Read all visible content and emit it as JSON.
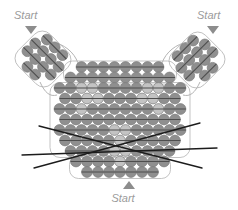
{
  "diagram": {
    "labels": {
      "top_left": "Start",
      "top_right": "Start",
      "bottom": "Start"
    },
    "colors": {
      "background": "#ffffff",
      "bead_dark": "#8f8f8f",
      "bead_light": "#c3c3c3",
      "bead_edge": "#7c7c7c",
      "thread": "#4e4e4e",
      "outline": "#b4b4b4",
      "whisker": "#1c1c1c",
      "label_text": "#9b9b9b",
      "arrow": "#8d8d8d"
    },
    "bead": {
      "size": 11,
      "radius": 5.4
    },
    "arrows": [
      {
        "name": "start-arrow-top-left-icon",
        "points": "25,26 37,26 31,34"
      },
      {
        "name": "start-arrow-top-right-icon",
        "points": "207,26 219,26 213,34"
      },
      {
        "name": "start-arrow-bottom-icon",
        "points": "123,189 135,189 129,181"
      }
    ],
    "ears": [
      {
        "name": "left-ear",
        "cx": 43,
        "cy": 59,
        "rot": 45,
        "rows": [
          3,
          4,
          4,
          2
        ]
      },
      {
        "name": "right-ear",
        "cx": 197,
        "cy": 60,
        "rot": -45,
        "rows": [
          3,
          4,
          4,
          2
        ]
      }
    ],
    "face": {
      "center_x": 120,
      "rows": [
        {
          "y": 67,
          "n": 8,
          "light": []
        },
        {
          "y": 77.5,
          "n": 10,
          "light": []
        },
        {
          "y": 88,
          "n": 12,
          "light": [
            2,
            3,
            8,
            9
          ]
        },
        {
          "y": 98.5,
          "n": 11,
          "light": [
            2,
            3,
            7,
            8
          ]
        },
        {
          "y": 109,
          "n": 12,
          "light": [
            2,
            9
          ]
        },
        {
          "y": 119.5,
          "n": 11,
          "light": []
        },
        {
          "y": 130,
          "n": 12,
          "light": [
            5,
            6
          ]
        },
        {
          "y": 140.5,
          "n": 11,
          "light": [
            5
          ]
        },
        {
          "y": 151,
          "n": 10,
          "light": [
            4,
            5
          ]
        },
        {
          "y": 161.5,
          "n": 9,
          "light": [
            4
          ]
        },
        {
          "y": 172,
          "n": 7,
          "light": []
        }
      ]
    },
    "outlines": [
      {
        "x": 63.5,
        "y": 61,
        "w": 113,
        "h": 23,
        "rx": 9
      },
      {
        "x": 50,
        "y": 82.5,
        "w": 140,
        "h": 75,
        "rx": 10
      },
      {
        "x": 69.5,
        "y": 155.5,
        "w": 101,
        "h": 23,
        "rx": 9
      }
    ],
    "threads": [
      "M 52,42 C 64,44 74,52 78,63",
      "M 40,82 C 45,93 50,97 57,95",
      "M 188,42 C 176,44 166,52 162,63",
      "M 200,82 C 195,93 190,97 183,95"
    ],
    "whiskers": [
      [
        39,
        126,
        202,
        168
      ],
      [
        34,
        168,
        200,
        123
      ],
      [
        22,
        155,
        217,
        148
      ]
    ]
  }
}
